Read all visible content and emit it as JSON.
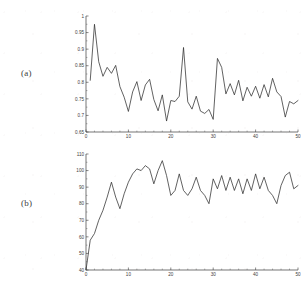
{
  "figure": {
    "panels": [
      {
        "label": "(a)"
      },
      {
        "label": "(b)"
      }
    ]
  },
  "chart_data": [
    {
      "type": "line",
      "panel": "(a)",
      "title": "",
      "xlabel": "",
      "ylabel": "",
      "xlim": [
        0,
        50
      ],
      "ylim": [
        0.65,
        1.0
      ],
      "xticks": [
        0,
        10,
        20,
        30,
        40,
        50
      ],
      "yticks": [
        0.65,
        0.7,
        0.75,
        0.8,
        0.85,
        0.9,
        0.95,
        1
      ],
      "ytick_labels": [
        "0.65",
        "0.7",
        "0.75",
        "0.8",
        "0.85",
        "0.9",
        "0.95",
        "1"
      ],
      "xtick_labels": [
        "0",
        "10",
        "20",
        "30",
        "40",
        "50"
      ],
      "grid": false,
      "legend": null,
      "x": [
        1,
        2,
        3,
        4,
        5,
        6,
        7,
        8,
        9,
        10,
        11,
        12,
        13,
        14,
        15,
        16,
        17,
        18,
        19,
        20,
        21,
        22,
        23,
        24,
        25,
        26,
        27,
        28,
        29,
        30,
        31,
        32,
        33,
        34,
        35,
        36,
        37,
        38,
        39,
        40,
        41,
        42,
        43,
        44,
        45,
        46,
        47,
        48,
        49,
        50
      ],
      "values": [
        0.806,
        0.975,
        0.862,
        0.818,
        0.845,
        0.827,
        0.851,
        0.787,
        0.755,
        0.712,
        0.771,
        0.802,
        0.745,
        0.792,
        0.809,
        0.748,
        0.714,
        0.762,
        0.683,
        0.745,
        0.742,
        0.758,
        0.905,
        0.741,
        0.719,
        0.758,
        0.713,
        0.706,
        0.718,
        0.688,
        0.872,
        0.845,
        0.765,
        0.796,
        0.762,
        0.806,
        0.744,
        0.785,
        0.758,
        0.788,
        0.752,
        0.793,
        0.756,
        0.812,
        0.771,
        0.757,
        0.695,
        0.742,
        0.735,
        0.745
      ]
    },
    {
      "type": "line",
      "panel": "(b)",
      "title": "",
      "xlabel": "",
      "ylabel": "",
      "xlim": [
        0,
        50
      ],
      "ylim": [
        40,
        110
      ],
      "xticks": [
        0,
        10,
        20,
        30,
        40,
        50
      ],
      "yticks": [
        40,
        50,
        60,
        70,
        80,
        90,
        100,
        110
      ],
      "ytick_labels": [
        "40",
        "50",
        "60",
        "70",
        "80",
        "90",
        "100",
        "110"
      ],
      "xtick_labels": [
        "0",
        "10",
        "20",
        "30",
        "40",
        "50"
      ],
      "grid": false,
      "legend": null,
      "x": [
        0,
        1,
        2,
        3,
        4,
        5,
        6,
        7,
        8,
        9,
        10,
        11,
        12,
        13,
        14,
        15,
        16,
        17,
        18,
        19,
        20,
        21,
        22,
        23,
        24,
        25,
        26,
        27,
        28,
        29,
        30,
        31,
        32,
        33,
        34,
        35,
        36,
        37,
        38,
        39,
        40,
        41,
        42,
        43,
        44,
        45,
        46,
        47,
        48,
        49,
        50
      ],
      "values": [
        40,
        58,
        62,
        70,
        76,
        84,
        93,
        84,
        77,
        86,
        93,
        98,
        101,
        100,
        103,
        101,
        92,
        100,
        106,
        97,
        85,
        88,
        98,
        88,
        85,
        89,
        96,
        88,
        85,
        80,
        95,
        89,
        97,
        88,
        96,
        88,
        95,
        86,
        95,
        88,
        98,
        89,
        96,
        88,
        85,
        80,
        91,
        97,
        99,
        89,
        91
      ]
    }
  ]
}
